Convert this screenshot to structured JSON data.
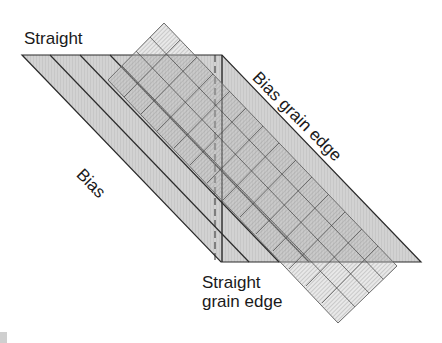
{
  "diagram": {
    "type": "fabric-grain-cutting-guide",
    "labels": {
      "straight_top": "Straight",
      "bias": "Bias",
      "bias_grain_edge": "Bias grain edge",
      "straight_grain_edge_line1": "Straight",
      "straight_grain_edge_line2": "grain edge"
    },
    "colors": {
      "fabric_fill": "#cfcfcf",
      "outline": "#2b2b2b",
      "ruler_fill": "#e4e4e4",
      "ruler_grid": "#555555",
      "text": "#1a1a1a"
    }
  }
}
